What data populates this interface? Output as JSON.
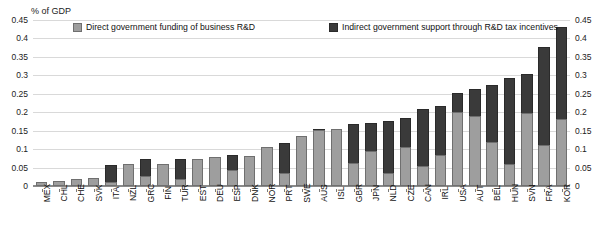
{
  "axis_unit_label": "% of GDP",
  "legend": {
    "direct_label": "Direct government funding of business R&D",
    "indirect_label": "Indirect government support through R&D tax incentives",
    "direct_color": "#9e9e9e",
    "indirect_color": "#3a3a3a"
  },
  "chart_data": {
    "type": "bar",
    "subtype": "stacked-vertical",
    "title": "",
    "subtitle": "",
    "xlabel": "",
    "ylabel": "% of GDP",
    "ylim": [
      0,
      0.45
    ],
    "ytick_values": [
      0,
      0.05,
      0.1,
      0.15,
      0.2,
      0.25,
      0.3,
      0.35,
      0.4,
      0.45
    ],
    "ytick_labels": [
      "0",
      "0.05",
      "0.1",
      "0.15",
      "0.2",
      "0.25",
      "0.3",
      "0.35",
      "0.4",
      "0.45"
    ],
    "right_axis": true,
    "right_ytick_labels": [
      "0",
      "0.05",
      "0.1",
      "0.15",
      "0.2",
      "0.25",
      "0.3",
      "0.35",
      "0.4",
      "0.45"
    ],
    "grid": true,
    "legend_position": "top-inside",
    "categories": [
      "MEX",
      "CHL",
      "CHE",
      "SVK",
      "ITA",
      "NZL",
      "GRC",
      "FIN",
      "TUR",
      "EST",
      "DEU",
      "ESP",
      "DNK",
      "NOR",
      "PRT",
      "SWE",
      "AUS",
      "ISL",
      "GBR",
      "JPN",
      "NLD",
      "CZE",
      "CAN",
      "IRL",
      "USA",
      "AUT",
      "BEL",
      "HUN",
      "SVN",
      "FRA",
      "KOR"
    ],
    "series": [
      {
        "name": "Direct government funding of business R&D",
        "color": "#9e9e9e",
        "values": [
          0.01,
          0.014,
          0.019,
          0.021,
          0.012,
          0.061,
          0.027,
          0.061,
          0.02,
          0.072,
          0.079,
          0.043,
          0.081,
          0.105,
          0.035,
          0.135,
          0.151,
          0.155,
          0.063,
          0.094,
          0.035,
          0.105,
          0.055,
          0.085,
          0.201,
          0.19,
          0.12,
          0.06,
          0.197,
          0.112,
          0.181
        ]
      },
      {
        "name": "Indirect government support through R&D tax incentives",
        "color": "#3a3a3a",
        "values": [
          0.001,
          0.0,
          0.0,
          0.0,
          0.045,
          0.0,
          0.045,
          0.0,
          0.053,
          0.0,
          0.0,
          0.042,
          0.0,
          0.0,
          0.081,
          0.0,
          0.004,
          0.0,
          0.104,
          0.076,
          0.14,
          0.08,
          0.155,
          0.131,
          0.052,
          0.072,
          0.155,
          0.232,
          0.107,
          0.265,
          0.249
        ]
      }
    ],
    "totals": [
      0.011,
      0.014,
      0.019,
      0.021,
      0.057,
      0.061,
      0.072,
      0.061,
      0.073,
      0.072,
      0.079,
      0.085,
      0.081,
      0.105,
      0.116,
      0.135,
      0.155,
      0.155,
      0.167,
      0.17,
      0.175,
      0.185,
      0.21,
      0.216,
      0.253,
      0.262,
      0.275,
      0.292,
      0.304,
      0.377,
      0.43
    ]
  }
}
